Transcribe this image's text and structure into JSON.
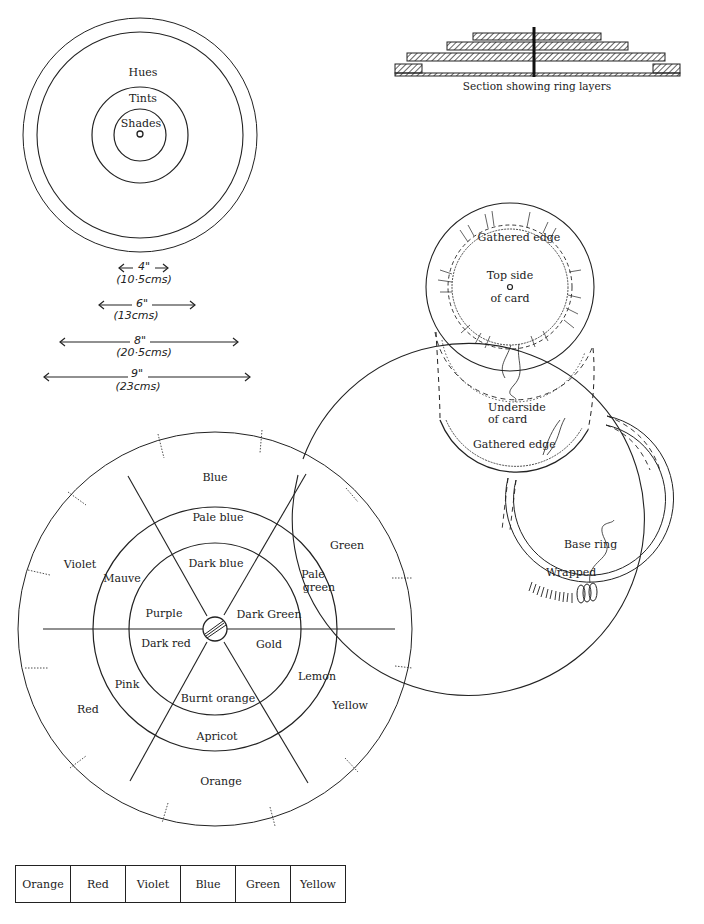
{
  "concentric_diagram": {
    "labels": [
      "Hues",
      "Tints",
      "Shades"
    ]
  },
  "measurements": [
    {
      "inches": "4\"",
      "cms": "(10·5cms)"
    },
    {
      "inches": "6\"",
      "cms": "(13cms)"
    },
    {
      "inches": "8\"",
      "cms": "(20·5cms)"
    },
    {
      "inches": "9\"",
      "cms": "(23cms)"
    }
  ],
  "section": {
    "caption": "Section showing ring layers"
  },
  "card_diagram": {
    "top_gathered_edge": "Gathered edge",
    "top_side": "Top side",
    "of_card_top": "of card",
    "underside": "Underside",
    "of_card_under": "of card",
    "bottom_gathered_edge": "Gathered edge",
    "base_ring": "Base ring",
    "wrapped": "Wrapped"
  },
  "color_wheel": {
    "hues": [
      "Blue",
      "Green",
      "Yellow",
      "Orange",
      "Red",
      "Violet"
    ],
    "tints": [
      "Pale blue",
      "Pale green",
      "Lemon",
      "Apricot",
      "Pink",
      "Mauve"
    ],
    "tints_pale_green_lines": [
      "Pale",
      "green"
    ],
    "shades": [
      "Dark blue",
      "Dark Green",
      "Gold",
      "Burnt orange",
      "Dark red",
      "Purple"
    ]
  },
  "sequence_table": {
    "cells": [
      "Orange",
      "Red",
      "Violet",
      "Blue",
      "Green",
      "Yellow"
    ]
  }
}
